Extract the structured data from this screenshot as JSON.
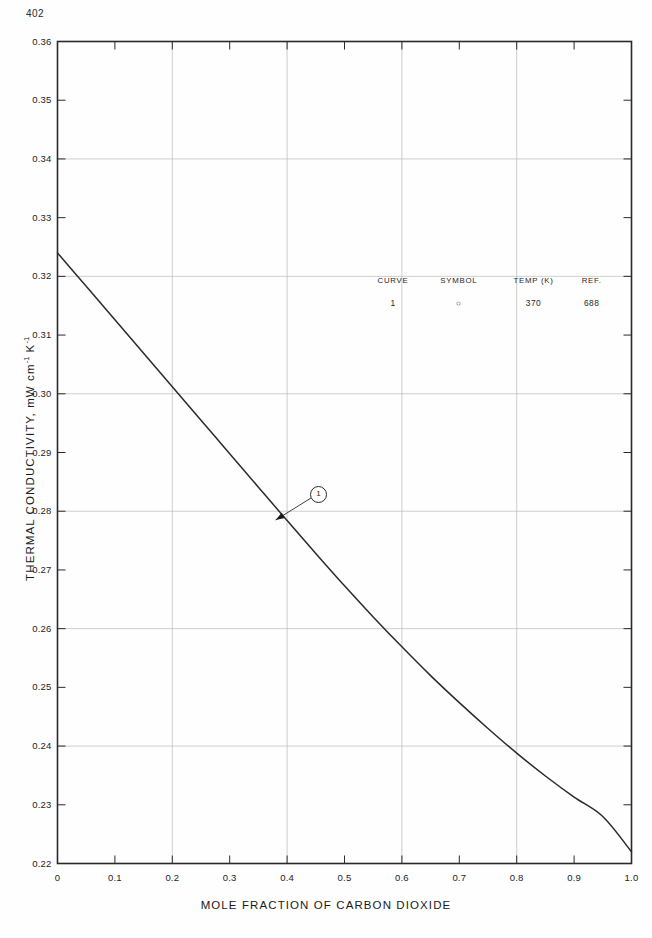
{
  "page": {
    "number": "402"
  },
  "figure": {
    "x_axis_title": "MOLE FRACTION OF CARBON DIOXIDE",
    "y_axis_title_main": "THERMAL CONDUCTIVITY, mW cm",
    "y_axis_title_sup1": "-1",
    "y_axis_title_mid": " K",
    "y_axis_title_sup2": "-1"
  },
  "legend": {
    "headers": [
      "CURVE",
      "SYMBOL",
      "TEMP (K)",
      "REF."
    ],
    "rows": [
      {
        "curve": "1",
        "symbol": "○",
        "temp": "370",
        "ref": "688"
      }
    ]
  },
  "callouts": [
    {
      "label": "1",
      "points_to_x": 0.38,
      "points_to_y": 0.2785
    }
  ],
  "chart_data": {
    "type": "line",
    "title": "",
    "xlabel": "MOLE FRACTION OF CARBON DIOXIDE",
    "ylabel": "THERMAL CONDUCTIVITY, mW cm-1 K-1",
    "xlim": [
      0.0,
      1.0
    ],
    "ylim": [
      0.22,
      0.36
    ],
    "xticks": [
      "0",
      "0.1",
      "0.2",
      "0.3",
      "0.4",
      "0.5",
      "0.6",
      "0.7",
      "0.8",
      "0.9",
      "1.0"
    ],
    "xtick_values": [
      0.0,
      0.1,
      0.2,
      0.3,
      0.4,
      0.5,
      0.6,
      0.7,
      0.8,
      0.9,
      1.0
    ],
    "yticks": [
      "0.22",
      "0.23",
      "0.24",
      "0.25",
      "0.26",
      "0.27",
      "0.28",
      "0.29",
      "0.30",
      "0.31",
      "0.32",
      "0.33",
      "0.34",
      "0.35",
      "0.36"
    ],
    "ytick_values": [
      0.22,
      0.23,
      0.24,
      0.25,
      0.26,
      0.27,
      0.28,
      0.29,
      0.3,
      0.31,
      0.32,
      0.33,
      0.34,
      0.35,
      0.36
    ],
    "x_gridlines": [
      0.2,
      0.4,
      0.6,
      0.8
    ],
    "y_gridlines": [
      0.24,
      0.26,
      0.28,
      0.3,
      0.32,
      0.34
    ],
    "grid": true,
    "legend_position": "upper-center-inside",
    "series": [
      {
        "name": "1",
        "temp_K": 370,
        "ref": 688,
        "symbol": "circle",
        "color": "#2a2a2a",
        "x": [
          0.0,
          0.05,
          0.1,
          0.15,
          0.2,
          0.25,
          0.3,
          0.35,
          0.4,
          0.45,
          0.5,
          0.55,
          0.6,
          0.65,
          0.7,
          0.75,
          0.8,
          0.85,
          0.9,
          0.95,
          1.0
        ],
        "values": [
          0.324,
          0.3183,
          0.3126,
          0.3069,
          0.3012,
          0.2955,
          0.2898,
          0.2841,
          0.2784,
          0.2728,
          0.2673,
          0.262,
          0.2569,
          0.252,
          0.2474,
          0.243,
          0.2388,
          0.2349,
          0.2313,
          0.228,
          0.222
        ]
      }
    ]
  }
}
